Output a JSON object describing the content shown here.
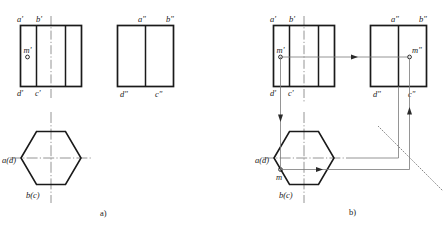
{
  "figure": {
    "title": "",
    "panels": [
      {
        "id": "a",
        "caption": "a)",
        "views": {
          "front": {
            "name": "front-view",
            "labels": {
              "top_left": "a'",
              "top_mid": "b'",
              "bottom_left": "d'",
              "bottom_mid": "c'",
              "point": "m'"
            }
          },
          "side": {
            "name": "side-view",
            "labels": {
              "top_left": "a\"",
              "top_right": "b\"",
              "bottom_left": "d\"",
              "bottom_right": "c\""
            }
          },
          "top": {
            "name": "top-view",
            "labels": {
              "left": "a(d)",
              "bottom": "b(c)"
            }
          }
        }
      },
      {
        "id": "b",
        "caption": "b)",
        "views": {
          "front": {
            "name": "front-view",
            "labels": {
              "top_left": "a'",
              "top_mid": "b'",
              "bottom_left": "d'",
              "bottom_mid": "c'",
              "point": "m'"
            }
          },
          "side": {
            "name": "side-view",
            "labels": {
              "top_left": "a\"",
              "top_right": "b\"",
              "bottom_left": "d\"",
              "bottom_right": "c\"",
              "point": "m\""
            }
          },
          "top": {
            "name": "top-view",
            "labels": {
              "left": "a(d)",
              "bottom": "b(c)",
              "point": "m"
            }
          }
        }
      }
    ]
  },
  "colors": {
    "outline": "#1a1a1a",
    "thin": "#6b6b6b",
    "centerline": "#6b6b6b",
    "projection": "#6b6b6b",
    "text": "#1a1a1a",
    "background": "#ffffff"
  }
}
